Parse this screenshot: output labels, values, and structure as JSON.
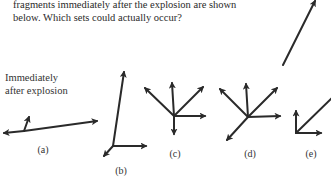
{
  "question": {
    "lines": [
      "fragments immediately after the explosion are shown",
      "below. Which sets could actually occur?"
    ]
  },
  "side_label": {
    "lines": [
      "Immediately",
      "after explosion"
    ]
  },
  "figures": [
    {
      "id": "a",
      "label": "(a)"
    },
    {
      "id": "b",
      "label": "(b)"
    },
    {
      "id": "c",
      "label": "(c)"
    },
    {
      "id": "d",
      "label": "(d)"
    },
    {
      "id": "e",
      "label": "(e)"
    }
  ],
  "colors": {
    "arrow": "#2a2a2a",
    "text": "#2a2a2a"
  }
}
